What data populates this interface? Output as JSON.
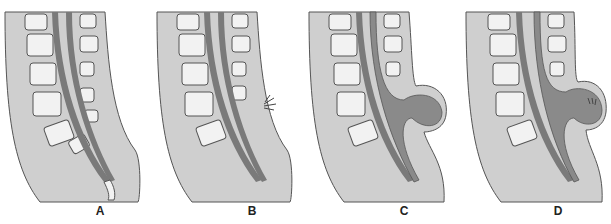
{
  "figure": {
    "type": "sagittal spine cross-section illustrations",
    "panels": [
      {
        "id": "A",
        "label": "A",
        "feature": "normal spine"
      },
      {
        "id": "B",
        "label": "B",
        "feature": "tuft of hair over defect"
      },
      {
        "id": "C",
        "label": "C",
        "feature": "fluid-filled sac protruding"
      },
      {
        "id": "D",
        "label": "D",
        "feature": "sac containing neural tissue"
      }
    ],
    "colors": {
      "body": "#cfcfcf",
      "outline": "#555555",
      "bone": "#f2f2f2",
      "marrow": "#9a9a9a",
      "cord": "#7a7a7a",
      "sac": "#8a8a8a",
      "background": "#ffffff"
    }
  }
}
